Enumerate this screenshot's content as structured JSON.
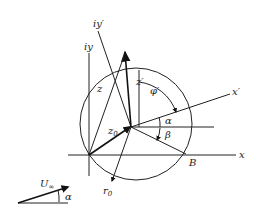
{
  "diagram": {
    "type": "conformal-mapping-geometry",
    "labels": {
      "iy_prime": "iy′",
      "iy": "iy",
      "z": "z",
      "z_prime": "z′",
      "phi_prime": "φ′",
      "x_prime": "x′",
      "alpha": "α",
      "beta": "β",
      "z0": "z",
      "z0_sub": "0",
      "x": "x",
      "B": "B",
      "r0": "r",
      "r0_sub": "0",
      "U_inf": "U",
      "U_inf_sub": "∞",
      "alpha_freestream": "α"
    },
    "colors": {
      "stroke": "#222222",
      "background": "#ffffff"
    }
  }
}
